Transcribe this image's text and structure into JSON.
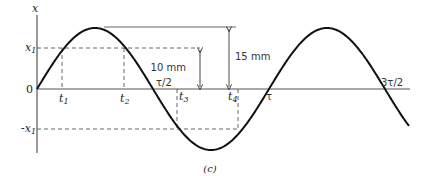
{
  "figure": {
    "caption": "(c)",
    "axis_labels": {
      "y": "x",
      "origin": "0"
    },
    "y_ticks": {
      "x1": "x",
      "x1_sub": "1",
      "neg_x1": "-x",
      "neg_x1_sub": "1"
    },
    "time_marks": [
      {
        "label": "t",
        "sub": "1"
      },
      {
        "label": "t",
        "sub": "2"
      },
      {
        "label": "t",
        "sub": "3"
      },
      {
        "label": "t",
        "sub": "4"
      }
    ],
    "period_marks": [
      "τ/2",
      "τ",
      "3τ/2"
    ],
    "dimensions": {
      "small": "10 mm",
      "large": "15 mm"
    },
    "colors": {
      "curve": "#111111",
      "axis": "#555555",
      "dash": "#555555"
    }
  },
  "chart_data": {
    "type": "line",
    "title": "",
    "xlabel": "t",
    "ylabel": "x",
    "amplitude_mm": 15,
    "x1_mm": 10,
    "x": [
      "0",
      "τ/4",
      "τ/2",
      "3τ/4",
      "τ",
      "5τ/4",
      "3τ/2"
    ],
    "series": [
      {
        "name": "x(t)",
        "values": [
          0,
          15,
          0,
          -15,
          0,
          15,
          0
        ]
      }
    ],
    "annotations": [
      "t1",
      "t2",
      "t3",
      "t4",
      "x1",
      "-x1",
      "10 mm",
      "15 mm"
    ],
    "grid": false
  }
}
